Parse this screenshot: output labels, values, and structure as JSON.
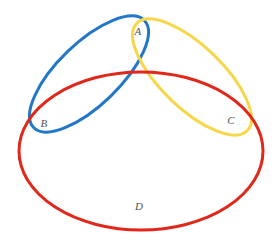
{
  "diagram": {
    "background_color": "#ffffff",
    "width": 277,
    "height": 245,
    "sets": [
      {
        "id": "set-blue",
        "label": "B",
        "label_x": 44,
        "label_y": 124,
        "color": "#2277c8",
        "stroke_width": 3,
        "cx": 89,
        "cy": 74,
        "rx": 77,
        "ry": 31,
        "rotate": -44
      },
      {
        "id": "set-yellow",
        "label": "C",
        "label_x": 231,
        "label_y": 121,
        "color": "#f7d749",
        "stroke_width": 3,
        "cx": 192,
        "cy": 77,
        "rx": 77,
        "ry": 31,
        "rotate": 44
      },
      {
        "id": "set-red",
        "label": "D",
        "label_x": 139,
        "label_y": 207,
        "color": "#e0271a",
        "stroke_width": 3,
        "cx": 141,
        "cy": 151,
        "rx": 122,
        "ry": 79,
        "rotate": 0
      }
    ],
    "intersection_labels": [
      {
        "id": "region-a",
        "label": "A",
        "label_x": 138,
        "label_y": 32,
        "description": "overlap of the blue and yellow ellipses"
      }
    ],
    "label_color": "#555555",
    "label_font_size": 11
  }
}
